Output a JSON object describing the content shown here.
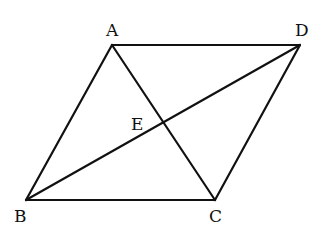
{
  "diagram": {
    "type": "parallelogram-with-diagonals",
    "points": {
      "A": {
        "label": "A",
        "x": 112,
        "y": 45,
        "lx": 106,
        "ly": 36
      },
      "D": {
        "label": "D",
        "x": 300,
        "y": 45,
        "lx": 295,
        "ly": 36
      },
      "B": {
        "label": "B",
        "x": 26,
        "y": 200,
        "lx": 14,
        "ly": 222
      },
      "C": {
        "label": "C",
        "x": 215,
        "y": 200,
        "lx": 209,
        "ly": 222
      },
      "E": {
        "label": "E",
        "x": 163,
        "y": 123,
        "lx": 131,
        "ly": 130
      }
    },
    "segments": [
      [
        "A",
        "D"
      ],
      [
        "A",
        "B"
      ],
      [
        "B",
        "C"
      ],
      [
        "C",
        "D"
      ],
      [
        "A",
        "C"
      ],
      [
        "B",
        "D"
      ]
    ]
  }
}
